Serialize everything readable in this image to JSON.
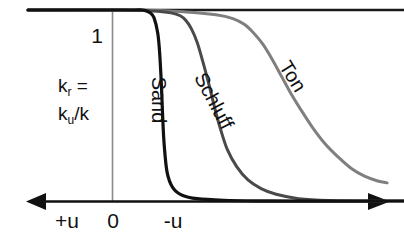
{
  "figure": {
    "title": "",
    "background_color": "#ffffff",
    "axis_color": "#111111",
    "gridline_color": "#8a8a8a"
  },
  "axis": {
    "y_tick_label": "1",
    "x_tick_labels": [
      "+u",
      "0",
      "-u"
    ],
    "y_axis_caption_line1_main": "k",
    "y_axis_caption_line1_sub": "r",
    "y_axis_caption_line1_tail": " =",
    "y_axis_caption_line2_main": "k",
    "y_axis_caption_line2_sub": "u",
    "y_axis_caption_line2_tail": "/k",
    "left_arrow_name": "left-arrowhead",
    "right_arrow_name": "right-arrowhead"
  },
  "chart_data": {
    "type": "line",
    "title": "",
    "xlabel": "",
    "ylabel": "k_r = k_u/k",
    "xlim": [
      0,
      1
    ],
    "ylim": [
      0,
      1
    ],
    "grid": false,
    "legend_position": "inline-labels",
    "x_tick_labels": [
      "+u",
      "0",
      "-u"
    ],
    "x_tick_positions": [
      0.17,
      0.3,
      0.45
    ],
    "y_tick_labels": [
      "1"
    ],
    "y_tick_positions": [
      1.0
    ],
    "annotations": [
      {
        "text": "1",
        "x": 0.255,
        "y": 0.88
      },
      {
        "text": "k_r = k_u/k",
        "x": 0.19,
        "y": 0.52
      }
    ],
    "series": [
      {
        "name": "Sand",
        "label": "Sand",
        "color": "#111111",
        "width": 3.2,
        "label_rotation": 90,
        "label_x": 0.355,
        "label_y": 0.44,
        "x": [
          0.0,
          0.2,
          0.28,
          0.305,
          0.315,
          0.325,
          0.335,
          0.345,
          0.35,
          0.355,
          0.358,
          0.362,
          0.37,
          0.385,
          0.41,
          0.45,
          0.52,
          0.62,
          0.75,
          1.0
        ],
        "y": [
          1.0,
          1.0,
          1.0,
          1.0,
          0.995,
          0.985,
          0.96,
          0.88,
          0.78,
          0.6,
          0.45,
          0.3,
          0.15,
          0.07,
          0.03,
          0.012,
          0.004,
          0.001,
          0.0,
          0.0
        ]
      },
      {
        "name": "Schluff",
        "label": "Schluff",
        "color": "#4a4a4a",
        "width": 3.0,
        "label_rotation": 62,
        "label_x": 0.5,
        "label_y": 0.45,
        "x": [
          0.0,
          0.25,
          0.33,
          0.38,
          0.405,
          0.42,
          0.435,
          0.45,
          0.465,
          0.48,
          0.495,
          0.51,
          0.53,
          0.555,
          0.585,
          0.62,
          0.66,
          0.72,
          0.8,
          1.0
        ],
        "y": [
          1.0,
          1.0,
          0.995,
          0.985,
          0.97,
          0.945,
          0.9,
          0.83,
          0.73,
          0.62,
          0.5,
          0.39,
          0.27,
          0.18,
          0.11,
          0.065,
          0.035,
          0.012,
          0.003,
          0.0
        ]
      },
      {
        "name": "Ton",
        "label": "Ton",
        "color": "#7f7f7f",
        "width": 3.0,
        "label_rotation": 58,
        "label_x": 0.7,
        "label_y": 0.63,
        "x": [
          0.0,
          0.28,
          0.42,
          0.5,
          0.545,
          0.575,
          0.6,
          0.625,
          0.65,
          0.675,
          0.7,
          0.725,
          0.755,
          0.79,
          0.825,
          0.86,
          0.895,
          0.93,
          0.955
        ],
        "y": [
          1.0,
          1.0,
          0.99,
          0.975,
          0.955,
          0.925,
          0.88,
          0.82,
          0.74,
          0.65,
          0.56,
          0.48,
          0.39,
          0.3,
          0.23,
          0.17,
          0.13,
          0.105,
          0.095
        ]
      }
    ]
  },
  "labels": {
    "sand": "Sand",
    "schluff": "Schluff",
    "ton": "Ton"
  }
}
